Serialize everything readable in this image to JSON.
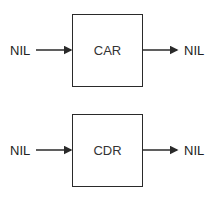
{
  "diagram": {
    "blocks": [
      {
        "id": "car",
        "label": "CAR",
        "input": "NIL",
        "output": "NIL"
      },
      {
        "id": "cdr",
        "label": "CDR",
        "input": "NIL",
        "output": "NIL"
      }
    ],
    "colors": {
      "line": "#2a2a2a",
      "background": "#ffffff"
    }
  }
}
